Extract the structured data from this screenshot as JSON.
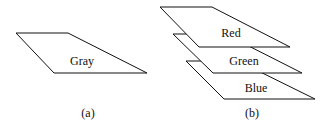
{
  "panel_a": {
    "plane_label": "Gray",
    "caption": "(a)"
  },
  "panel_b": {
    "planes": [
      {
        "label": "Red"
      },
      {
        "label": "Green"
      },
      {
        "label": "Blue"
      }
    ],
    "caption": "(b)"
  },
  "colors": {
    "stroke": "#111111",
    "background": "#ffffff"
  }
}
